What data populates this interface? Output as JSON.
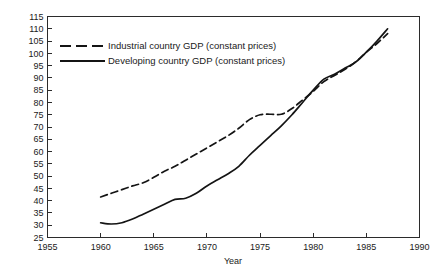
{
  "chart_data": {
    "type": "line",
    "title": "",
    "xlabel": "Year",
    "ylabel": "",
    "xlim": [
      1955,
      1990
    ],
    "ylim": [
      25,
      115
    ],
    "xticks": [
      1955,
      1960,
      1965,
      1970,
      1975,
      1980,
      1985,
      1990
    ],
    "yticks": [
      25,
      30,
      35,
      40,
      45,
      50,
      55,
      60,
      65,
      70,
      75,
      80,
      85,
      90,
      95,
      100,
      105,
      110,
      115
    ],
    "grid": false,
    "legend_position": "upper-left-inside",
    "series": [
      {
        "name": "Industrial country GDP (constant prices)",
        "style": "dashed",
        "color": "#141414",
        "x": [
          1960,
          1961,
          1962,
          1963,
          1964,
          1965,
          1966,
          1967,
          1968,
          1969,
          1970,
          1971,
          1972,
          1973,
          1974,
          1975,
          1976,
          1977,
          1978,
          1979,
          1980,
          1981,
          1982,
          1983,
          1984,
          1985,
          1986,
          1987
        ],
        "values": [
          41.5,
          43.0,
          44.5,
          46.0,
          47.3,
          49.5,
          52.0,
          54.0,
          56.5,
          59.0,
          61.5,
          64.0,
          66.5,
          69.5,
          73.0,
          75.0,
          75.2,
          75.2,
          77.5,
          81.0,
          84.5,
          88.5,
          91.0,
          93.5,
          96.5,
          100.5,
          104.0,
          108.0
        ]
      },
      {
        "name": "Developing country GDP (constant prices)",
        "style": "solid",
        "color": "#141414",
        "x": [
          1960,
          1961,
          1962,
          1963,
          1964,
          1965,
          1966,
          1967,
          1968,
          1969,
          1970,
          1971,
          1972,
          1973,
          1974,
          1975,
          1976,
          1977,
          1978,
          1979,
          1980,
          1981,
          1982,
          1983,
          1984,
          1985,
          1986,
          1987
        ],
        "values": [
          31.0,
          30.5,
          31.0,
          32.5,
          34.5,
          36.5,
          38.5,
          40.5,
          41.0,
          43.0,
          46.0,
          48.5,
          51.0,
          54.0,
          58.5,
          62.5,
          66.5,
          70.5,
          75.0,
          80.0,
          85.0,
          89.5,
          91.5,
          94.0,
          96.5,
          100.5,
          105.0,
          110.0
        ]
      }
    ]
  },
  "axis": {
    "x_title": "Year",
    "x_tick_labels": [
      "1955",
      "1960",
      "1965",
      "1970",
      "1975",
      "1980",
      "1985",
      "1990"
    ],
    "y_tick_labels": [
      "115",
      "110",
      "105",
      "100",
      "95",
      "90",
      "85",
      "80",
      "75",
      "70",
      "65",
      "60",
      "55",
      "50",
      "45",
      "40",
      "35",
      "30",
      "25"
    ]
  },
  "legend": {
    "entries": [
      {
        "label": "Industrial country GDP (constant prices)",
        "style": "dashed"
      },
      {
        "label": "Developing country GDP (constant prices)",
        "style": "solid"
      }
    ]
  }
}
